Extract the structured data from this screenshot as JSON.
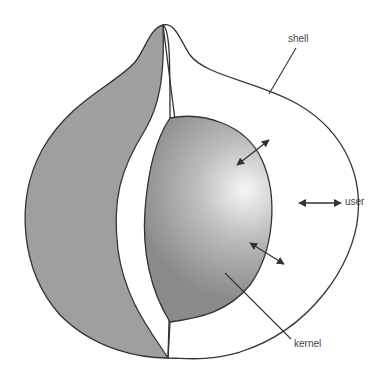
{
  "diagram": {
    "type": "layered-sphere",
    "layers": [
      {
        "id": "kernel",
        "label": "kernel"
      },
      {
        "id": "shell",
        "label": "shell"
      },
      {
        "id": "user",
        "label": "user"
      }
    ],
    "colors": {
      "stroke": "#333333",
      "outer_fill": "#9e9e9e",
      "band_fill": "#ffffff",
      "kernel_light": "#f4f4f4",
      "kernel_dark": "#8c8c8c"
    }
  }
}
